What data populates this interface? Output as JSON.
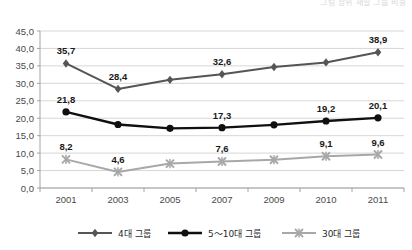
{
  "top_caption": "그림  상위 재벌 그룹 비중",
  "chart_data": {
    "type": "line",
    "title": "",
    "subtitle": "",
    "xlabel": "",
    "ylabel": "",
    "x": [
      "2001",
      "2003",
      "2005",
      "2007",
      "2009",
      "2010",
      "2011"
    ],
    "categories": [
      "2001",
      "2003",
      "2005",
      "2007",
      "2009",
      "2010",
      "2011"
    ],
    "ylim": [
      0,
      45
    ],
    "ytick_values": [
      0,
      5,
      10,
      15,
      20,
      25,
      30,
      35,
      40,
      45
    ],
    "ytick_labels": [
      "0,0",
      "5,0",
      "10,0",
      "15,0",
      "20,0",
      "25,0",
      "30,0",
      "35,0",
      "40,0",
      "45,0"
    ],
    "grid": true,
    "legend_position": "bottom",
    "decimal_separator": ",",
    "series": [
      {
        "name": "4대 그룹",
        "marker": "diamond",
        "color": "#555555",
        "values": [
          35.7,
          28.4,
          31.0,
          32.6,
          34.7,
          36.0,
          38.9
        ],
        "labels": [
          "35,7",
          "28,4",
          "",
          "32,6",
          "",
          "",
          "38,9"
        ],
        "label_positions": [
          "above",
          "above",
          "",
          "above",
          "",
          "",
          "above"
        ]
      },
      {
        "name": "5〜10대 그룹",
        "marker": "circle",
        "color": "#101010",
        "values": [
          21.8,
          18.2,
          17.1,
          17.3,
          18.1,
          19.2,
          20.1
        ],
        "labels": [
          "21,8",
          "",
          "",
          "17,3",
          "",
          "19,2",
          "20,1"
        ],
        "label_positions": [
          "above",
          "",
          "",
          "above",
          "",
          "above",
          "above"
        ]
      },
      {
        "name": "30대 그룹",
        "marker": "cross",
        "color": "#a8a8a8",
        "values": [
          8.2,
          4.6,
          7.0,
          7.6,
          8.1,
          9.1,
          9.6
        ],
        "labels": [
          "8,2",
          "4,6",
          "",
          "7,6",
          "",
          "9,1",
          "9,6"
        ],
        "label_positions": [
          "above",
          "above",
          "",
          "above",
          "",
          "above",
          "above"
        ]
      }
    ]
  },
  "legend": {
    "items": [
      {
        "label": "4대 그룹",
        "marker": "diamond",
        "color": "#555555"
      },
      {
        "label": "5〜10대 그룹",
        "marker": "circle",
        "color": "#101010"
      },
      {
        "label": "30대 그룹",
        "marker": "cross",
        "color": "#a8a8a8"
      }
    ]
  }
}
